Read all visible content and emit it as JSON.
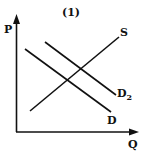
{
  "title": "(1)",
  "axes": {
    "y_label": "P",
    "x_label": "Q"
  },
  "curves": [
    {
      "id": "S",
      "label": "S",
      "subscript": "",
      "role": "supply",
      "slope": "upward"
    },
    {
      "id": "D",
      "label": "D",
      "subscript": "",
      "role": "demand",
      "slope": "downward"
    },
    {
      "id": "D2",
      "label": "D",
      "subscript": "2",
      "role": "shifted demand",
      "slope": "downward"
    }
  ],
  "colors": {
    "ink": "#111111",
    "background": "#ffffff"
  }
}
